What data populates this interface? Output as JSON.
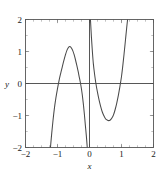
{
  "chart_data": {
    "type": "line",
    "title": "",
    "xlabel": "x",
    "ylabel": "y",
    "xlim": [
      -2,
      2
    ],
    "ylim": [
      -2,
      2
    ],
    "grid": false,
    "legend": null,
    "x_ticks": [
      -2,
      -1,
      0,
      1,
      2
    ],
    "x_tick_labels": [
      "−2",
      "−1",
      "0",
      "1",
      "2"
    ],
    "y_ticks": [
      -2,
      -1,
      0,
      1,
      2
    ],
    "y_tick_labels": [
      "−2",
      "−1",
      "0",
      "1",
      "2"
    ],
    "x_minor_tick_step": 0.25,
    "y_minor_tick_step": 0.5,
    "axis_zero_line_y": 0,
    "axis_zero_line_x": 0,
    "pole_x": 0,
    "annotations": [],
    "series": [
      {
        "name": "curve-branch-left",
        "points": [
          [
            -1.22,
            -2.0
          ],
          [
            -1.18,
            -1.55
          ],
          [
            -1.14,
            -1.15
          ],
          [
            -1.1,
            -0.8
          ],
          [
            -1.05,
            -0.45
          ],
          [
            -1.0,
            -0.16
          ],
          [
            -0.95,
            0.1
          ],
          [
            -0.9,
            0.32
          ],
          [
            -0.85,
            0.52
          ],
          [
            -0.8,
            0.72
          ],
          [
            -0.75,
            0.9
          ],
          [
            -0.7,
            1.05
          ],
          [
            -0.65,
            1.14
          ],
          [
            -0.6,
            1.15
          ],
          [
            -0.56,
            1.1
          ],
          [
            -0.52,
            1.02
          ],
          [
            -0.48,
            0.9
          ],
          [
            -0.44,
            0.75
          ],
          [
            -0.4,
            0.58
          ],
          [
            -0.36,
            0.4
          ],
          [
            -0.32,
            0.2
          ],
          [
            -0.28,
            0.0
          ],
          [
            -0.25,
            -0.18
          ],
          [
            -0.22,
            -0.4
          ],
          [
            -0.19,
            -0.66
          ],
          [
            -0.16,
            -0.96
          ],
          [
            -0.13,
            -1.3
          ],
          [
            -0.1,
            -1.62
          ],
          [
            -0.07,
            -2.0
          ]
        ]
      },
      {
        "name": "curve-branch-right",
        "points": [
          [
            0.03,
            2.0
          ],
          [
            0.06,
            1.45
          ],
          [
            0.09,
            1.0
          ],
          [
            0.12,
            0.62
          ],
          [
            0.16,
            0.28
          ],
          [
            0.2,
            0.0
          ],
          [
            0.25,
            -0.28
          ],
          [
            0.3,
            -0.52
          ],
          [
            0.35,
            -0.72
          ],
          [
            0.4,
            -0.89
          ],
          [
            0.45,
            -1.01
          ],
          [
            0.5,
            -1.1
          ],
          [
            0.55,
            -1.14
          ],
          [
            0.6,
            -1.16
          ],
          [
            0.65,
            -1.14
          ],
          [
            0.7,
            -1.08
          ],
          [
            0.75,
            -0.98
          ],
          [
            0.8,
            -0.82
          ],
          [
            0.85,
            -0.62
          ],
          [
            0.9,
            -0.38
          ],
          [
            0.95,
            -0.1
          ],
          [
            1.0,
            0.22
          ],
          [
            1.04,
            0.55
          ],
          [
            1.08,
            0.92
          ],
          [
            1.12,
            1.32
          ],
          [
            1.16,
            1.72
          ],
          [
            1.19,
            2.0
          ]
        ]
      }
    ]
  }
}
